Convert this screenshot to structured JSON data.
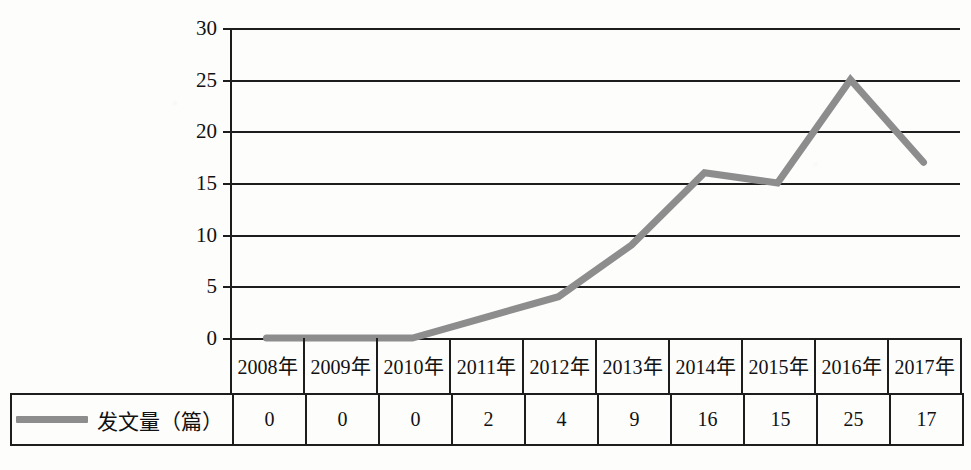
{
  "chart_data": {
    "type": "line",
    "title": "",
    "xlabel": "",
    "ylabel": "",
    "categories": [
      "2008年",
      "2009年",
      "2010年",
      "2011年",
      "2012年",
      "2013年",
      "2014年",
      "2015年",
      "2016年",
      "2017年"
    ],
    "series": [
      {
        "name": "发文量（篇）",
        "values": [
          0,
          0,
          0,
          2,
          4,
          9,
          16,
          15,
          25,
          17
        ],
        "color": "#8d8d8d"
      }
    ],
    "ylim": [
      0,
      30
    ],
    "yticks": [
      0,
      5,
      10,
      15,
      20,
      25,
      30
    ],
    "ytick_labels": [
      "0",
      "5",
      "10",
      "15",
      "20",
      "25",
      "30"
    ],
    "grid": true,
    "grid_orientation": "horizontal",
    "legend_position": "bottom-left-table-cell",
    "legend_entries": [
      "发文量（篇）"
    ],
    "data_table": {
      "header_row": [
        "2008年",
        "2009年",
        "2010年",
        "2011年",
        "2012年",
        "2013年",
        "2014年",
        "2015年",
        "2016年",
        "2017年"
      ],
      "value_row_label": "发文量（篇）",
      "value_row": [
        "0",
        "0",
        "0",
        "2",
        "4",
        "9",
        "16",
        "15",
        "25",
        "17"
      ]
    }
  },
  "colors": {
    "line": "#8d8d8d",
    "axis": "#1d1d1d",
    "text": "#111111",
    "background": "#fdfdfc"
  }
}
